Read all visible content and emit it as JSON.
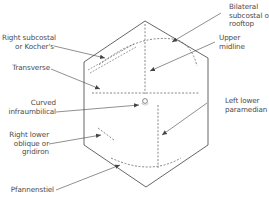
{
  "colors": {
    "outline": "#555555",
    "incision": "#555555",
    "text": "#4a4a4a",
    "background": "#ffffff"
  },
  "labels": {
    "right_subcostal": {
      "line1": "Right subcostal",
      "line2": "or Kocher's"
    },
    "transverse": {
      "line1": "Transverse"
    },
    "curved_infraumbilical": {
      "line1": "Curved",
      "line2": "infraumbilical"
    },
    "right_lower_oblique": {
      "line1": "Right lower",
      "line2": "oblique or",
      "line3": "gridiron"
    },
    "pfannenstiel": {
      "line1": "Pfannenstiel"
    },
    "bilateral_subcostal": {
      "line1": "Bilateral",
      "line2": "subcostal or",
      "line3": "rooftop"
    },
    "upper_midline": {
      "line1": "Upper",
      "line2": "midline"
    },
    "left_lower_paramedian": {
      "line1": "Left lower",
      "line2": "paramedian"
    }
  },
  "shapes": {
    "torso_outline": "hexagon",
    "umbilicus": "circle"
  }
}
